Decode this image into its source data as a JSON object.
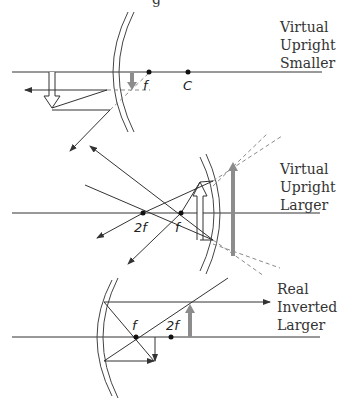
{
  "top_fragment": "g",
  "diagrams": [
    {
      "id": "convex",
      "caption": [
        "Virtual",
        "Upright",
        "Smaller"
      ],
      "points": [
        {
          "label": "f"
        },
        {
          "label": "C"
        }
      ]
    },
    {
      "id": "concave-inside-f",
      "caption": [
        "Virtual",
        "Upright",
        "Larger"
      ],
      "points": [
        {
          "label": "2f"
        },
        {
          "label": "f"
        }
      ]
    },
    {
      "id": "concave-between-f-2f",
      "caption": [
        "Real",
        "Inverted",
        "Larger"
      ],
      "points": [
        {
          "label": "f"
        },
        {
          "label": "2f"
        }
      ]
    }
  ],
  "colors": {
    "line": "#333333",
    "image_arrow": "#8c8c8c",
    "dashed": "#8a8a8a"
  }
}
